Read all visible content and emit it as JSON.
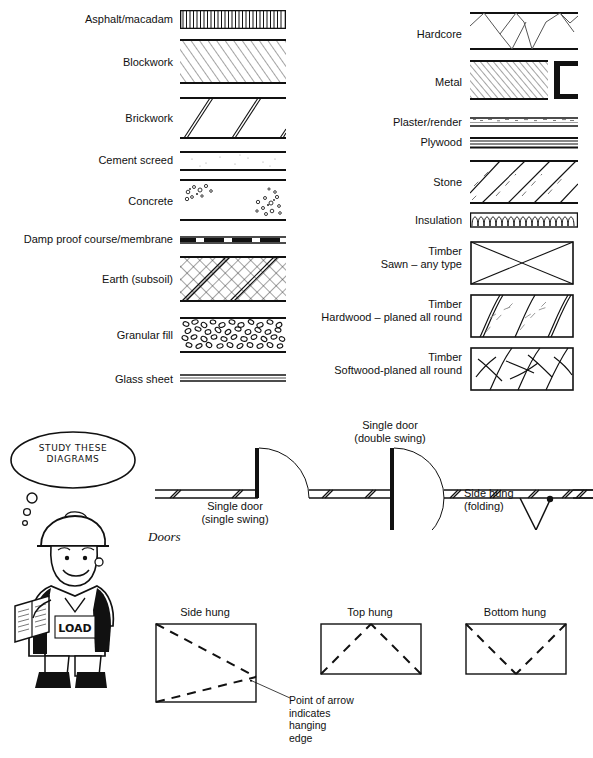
{
  "sheet": {
    "title": "Architectural drawing hatch symbols reference",
    "doors_caption": "Doors"
  },
  "materials_left": [
    {
      "label": "Asphalt/macadam",
      "pattern": "vertical-hatch-band"
    },
    {
      "label": "Blockwork",
      "pattern": "diagonal-fine-hatch"
    },
    {
      "label": "Brickwork",
      "pattern": "sparse-double-diagonal"
    },
    {
      "label": "Cement screed",
      "pattern": "stipple-light"
    },
    {
      "label": "Concrete",
      "pattern": "aggregate-dots"
    },
    {
      "label": "Damp proof course/membrane",
      "pattern": "dashed-heavy-line"
    },
    {
      "label": "Earth (subsoil)",
      "pattern": "cross-diagonal-hatch"
    },
    {
      "label": "Granular fill",
      "pattern": "pebble-fill"
    },
    {
      "label": "Glass sheet",
      "pattern": "thin-triple-line"
    }
  ],
  "materials_right": [
    {
      "label": "Hardcore",
      "pattern": "zigzag-band"
    },
    {
      "label": "Metal",
      "pattern": "dense-diagonal-hatch-with-channel"
    },
    {
      "label": "Plaster/render",
      "pattern": "fine-speckle-band"
    },
    {
      "label": "Plywood",
      "pattern": "multi-thin-line"
    },
    {
      "label": "Stone",
      "pattern": "diagonal-with-dashes"
    },
    {
      "label": "Insulation",
      "pattern": "loop-batt"
    },
    {
      "label": "Timber\nSawn – any type",
      "pattern": "box-with-cross"
    },
    {
      "label": "Timber\nHardwood – planed all round",
      "pattern": "grain-sweeping-hardwood"
    },
    {
      "label": "Timber\nSoftwood-planed all round",
      "pattern": "grain-sweeping-softwood"
    }
  ],
  "doors": {
    "caption": "Doors",
    "items": [
      {
        "label": "Single door\n(single swing)"
      },
      {
        "label": "Single door\n(double swing)"
      },
      {
        "label": "Side hung\n(folding)"
      }
    ]
  },
  "windows": {
    "items": [
      {
        "label": "Side hung"
      },
      {
        "label": "Top hung"
      },
      {
        "label": "Bottom hung"
      }
    ],
    "note": "Point of arrow\nindicates\nhanging\nedge"
  },
  "character": {
    "speech": "STUDY\nTHESE\nDIAGRAMS"
  },
  "colors": {
    "ink": "#111111",
    "paper": "#ffffff"
  }
}
